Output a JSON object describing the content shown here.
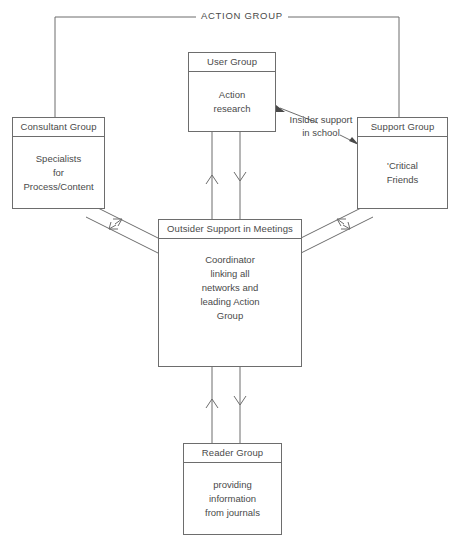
{
  "diagram": {
    "title_label": "ACTION GROUP",
    "annotation": {
      "text": "Insider support\nin school"
    },
    "nodes": {
      "user_group": {
        "header": "User Group",
        "body": "Action\nresearch"
      },
      "consultant_group": {
        "header": "Consultant Group",
        "body": "Specialists\nfor\nProcess/Content"
      },
      "support_group": {
        "header": "Support Group",
        "body": "'Critical\nFriends"
      },
      "coordinator": {
        "header": "Outsider Support in Meetings",
        "body": "Coordinator\nlinking all\nnetworks and\nleading Action\nGroup"
      },
      "reader_group": {
        "header": "Reader Group",
        "body": "providing\ninformation\nfrom journals"
      }
    },
    "colors": {
      "line": "#6d6d6d",
      "text": "#4a4a4a",
      "background": "#ffffff"
    }
  }
}
